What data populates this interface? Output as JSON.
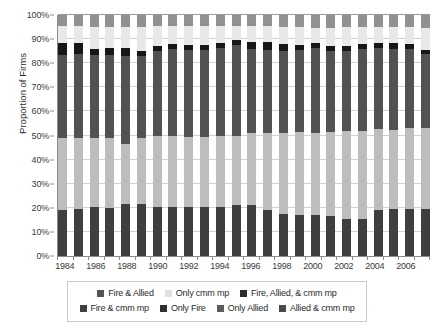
{
  "chart_data": {
    "type": "bar",
    "subtype": "stacked-bar-100-percent",
    "title": "",
    "xlabel": "",
    "ylabel": "Proportion of Firms",
    "ylim": [
      0,
      100
    ],
    "ytick_labels": [
      "0%",
      "10%",
      "20%",
      "30%",
      "40%",
      "50%",
      "60%",
      "70%",
      "80%",
      "90%",
      "100%"
    ],
    "ytick_values": [
      0,
      10,
      20,
      30,
      40,
      50,
      60,
      70,
      80,
      90,
      100
    ],
    "grid": true,
    "legend_position": "bottom",
    "categories": [
      "1984",
      "1985",
      "1986",
      "1987",
      "1988",
      "1989",
      "1990",
      "1991",
      "1992",
      "1993",
      "1994",
      "1995",
      "1996",
      "1997",
      "1998",
      "1999",
      "2000",
      "2001",
      "2002",
      "2003",
      "2004",
      "2005",
      "2006",
      "2007"
    ],
    "xtick_labels_shown": [
      "1984",
      "1986",
      "1988",
      "1990",
      "1992",
      "1994",
      "1996",
      "1998",
      "2000",
      "2002",
      "2004",
      "2006"
    ],
    "stack_order_bottom_to_top": [
      "Fire & cmm mp",
      "Only Fire",
      "Fire & Allied",
      "Fire, Allied, & cmm mp",
      "Only cmm mp",
      "Only Allied"
    ],
    "series": [
      {
        "name": "Fire & cmm mp",
        "color": "#3f3f3f",
        "values": [
          19.0,
          19.5,
          20.5,
          20.0,
          21.5,
          21.5,
          20.5,
          20.5,
          20.5,
          20.5,
          20.5,
          21.0,
          21.0,
          19.0,
          17.5,
          17.0,
          17.0,
          16.5,
          15.5,
          15.5,
          19.0,
          19.5,
          19.5,
          19.5
        ]
      },
      {
        "name": "Only Fire",
        "color": "#bdbdbd",
        "values": [
          30.0,
          29.5,
          28.5,
          29.0,
          25.0,
          27.5,
          29.5,
          29.5,
          29.0,
          29.0,
          29.5,
          29.0,
          30.0,
          32.0,
          33.5,
          34.5,
          34.0,
          35.0,
          36.5,
          36.5,
          33.5,
          33.0,
          33.5,
          33.5
        ]
      },
      {
        "name": "Fire & Allied",
        "color": "#525252",
        "values": [
          34.5,
          35.0,
          34.5,
          34.5,
          36.5,
          34.0,
          35.0,
          36.0,
          36.0,
          36.0,
          36.5,
          37.5,
          35.0,
          34.5,
          34.0,
          34.0,
          35.5,
          33.5,
          33.0,
          34.0,
          34.0,
          33.5,
          33.0,
          31.0
        ]
      },
      {
        "name": "Fire, Allied, & cmm mp",
        "color": "#171717",
        "values": [
          5.0,
          4.5,
          2.5,
          3.0,
          3.5,
          2.0,
          2.0,
          2.0,
          2.0,
          2.0,
          2.0,
          2.0,
          3.0,
          3.5,
          3.0,
          2.0,
          2.0,
          2.0,
          2.0,
          2.0,
          2.0,
          2.5,
          2.0,
          1.5
        ]
      },
      {
        "name": "Only cmm mp",
        "color": "#e8e8e8",
        "values": [
          7.0,
          7.0,
          9.0,
          8.5,
          8.5,
          10.0,
          8.5,
          7.5,
          8.0,
          8.0,
          7.0,
          6.0,
          6.5,
          6.5,
          7.0,
          7.5,
          6.0,
          7.5,
          8.0,
          7.0,
          6.5,
          6.5,
          7.0,
          9.0
        ]
      },
      {
        "name": "Only Allied",
        "color": "#919191",
        "values": [
          4.5,
          4.5,
          5.0,
          5.0,
          5.0,
          5.0,
          4.5,
          4.5,
          4.5,
          4.5,
          4.5,
          4.5,
          4.5,
          4.5,
          5.0,
          5.0,
          5.5,
          5.5,
          5.0,
          5.0,
          5.0,
          5.0,
          5.0,
          5.5
        ]
      }
    ]
  },
  "legend": {
    "rows": [
      [
        {
          "label": "Fire & Allied",
          "color": "#525252"
        },
        {
          "label": "Only cmm mp",
          "color": "#e0e0e0"
        },
        {
          "label": "Fire, Allied, & cmm mp",
          "color": "#2b2b2b"
        }
      ],
      [
        {
          "label": "Fire & cmm mp",
          "color": "#3f3f3f"
        },
        {
          "label": "Only Fire",
          "color": "#303030"
        },
        {
          "label": "Only Allied",
          "color": "#5c5c5c"
        },
        {
          "label": "Allied & cmm mp",
          "color": "#4a4a4a"
        }
      ]
    ]
  },
  "axis": {
    "y_title": "Proportion of Firms"
  }
}
